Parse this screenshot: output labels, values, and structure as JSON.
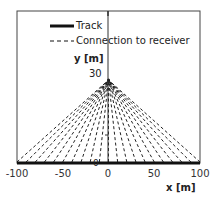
{
  "chart_data": {
    "type": "line",
    "title": "",
    "xlabel": "x [m]",
    "ylabel": "y [m]",
    "xlim": [
      -100,
      100
    ],
    "ylim": [
      0,
      55
    ],
    "x_ticks": [
      -100,
      -50,
      0,
      50,
      100
    ],
    "y_tick_labels": [
      "30",
      "0"
    ],
    "grid": false,
    "legend_position": "upper-left",
    "receiver": {
      "x": 0,
      "y": 30
    },
    "series": [
      {
        "name": "Track",
        "style": "solid-thick",
        "x": [
          -100,
          100
        ],
        "y": [
          0,
          0
        ]
      },
      {
        "name": "Connection to receiver",
        "style": "dashed",
        "x_track_endpoints": [
          -100,
          -90,
          -80,
          -70,
          -60,
          -50,
          -40,
          -30,
          -20,
          -10,
          0,
          10,
          20,
          30,
          40,
          50,
          60,
          70,
          80,
          90,
          100
        ],
        "to": [
          0,
          30
        ]
      }
    ]
  },
  "legend": {
    "track_label": "Track",
    "connection_label": "Connection to receiver"
  },
  "axes": {
    "x_title": "x [m]",
    "y_title": "y [m]",
    "x_ticks": [
      "-100",
      "-50",
      "0",
      "50",
      "100"
    ],
    "y_tick_30": "30",
    "y_tick_0": "0"
  }
}
